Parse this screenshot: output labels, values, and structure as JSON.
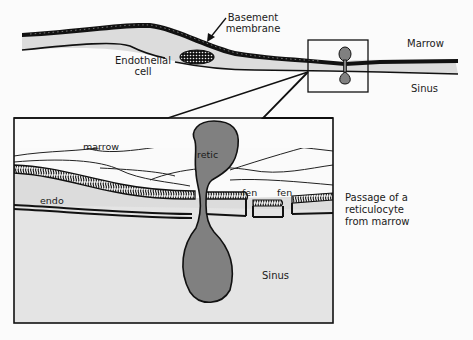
{
  "diagram": {
    "title": "Passage of a reticulocyte from marrow",
    "overview": {
      "labels": {
        "basement_membrane_line1": "Basement",
        "basement_membrane_line2": "membrane",
        "endothelial_cell_line1": "Endothelial",
        "endothelial_cell_line2": "cell",
        "marrow": "Marrow",
        "sinus": "Sinus"
      }
    },
    "detail": {
      "labels": {
        "marrow": "marrow",
        "retic": "retic",
        "endo": "endo",
        "fen_1": "fen",
        "fen_2": "fen",
        "sinus": "Sinus"
      }
    },
    "caption": {
      "line1": "Passage of a",
      "line2": "reticulocyte",
      "line3": "from marrow"
    },
    "colors": {
      "outline": "#111111",
      "cell_fill": "#808080",
      "endothelium_fill": "#dcdcdc",
      "sinus_fill": "#e6e6e6",
      "background": "#fbfbfb"
    }
  }
}
